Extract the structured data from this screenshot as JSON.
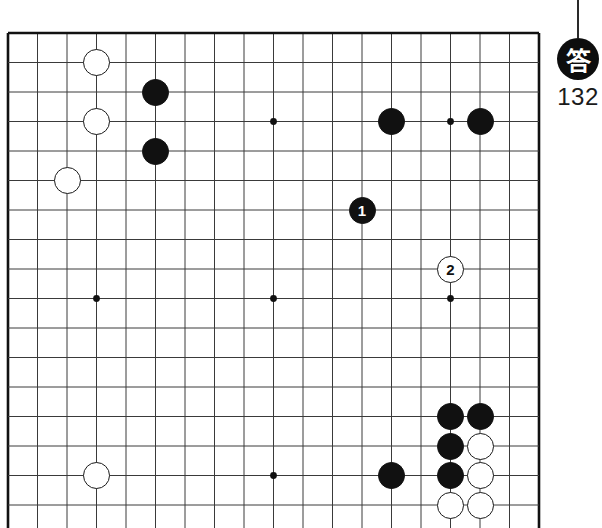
{
  "diagram": {
    "type": "go-board-problem",
    "board": {
      "origin_x": 8,
      "origin_y": 33,
      "spacing": 29.5,
      "cols": 18,
      "rows": 17,
      "line_color": "#3a3a3a",
      "border_color": "#111111",
      "background": "#ffffff",
      "star_points": [
        {
          "col": 3,
          "row": 3
        },
        {
          "col": 9,
          "row": 3
        },
        {
          "col": 15,
          "row": 3
        },
        {
          "col": 3,
          "row": 9
        },
        {
          "col": 9,
          "row": 9
        },
        {
          "col": 15,
          "row": 9
        },
        {
          "col": 9,
          "row": 15
        }
      ]
    },
    "stones": [
      {
        "color": "white",
        "col": 3,
        "row": 1,
        "label": ""
      },
      {
        "color": "black",
        "col": 5,
        "row": 2,
        "label": ""
      },
      {
        "color": "white",
        "col": 3,
        "row": 3,
        "label": ""
      },
      {
        "color": "black",
        "col": 5,
        "row": 4,
        "label": ""
      },
      {
        "color": "white",
        "col": 2,
        "row": 5,
        "label": ""
      },
      {
        "color": "black",
        "col": 13,
        "row": 3,
        "label": ""
      },
      {
        "color": "black",
        "col": 16,
        "row": 3,
        "label": ""
      },
      {
        "color": "black",
        "col": 12,
        "row": 6,
        "label": "1"
      },
      {
        "color": "white",
        "col": 15,
        "row": 8,
        "label": "2"
      },
      {
        "color": "black",
        "col": 15,
        "row": 13,
        "label": ""
      },
      {
        "color": "black",
        "col": 16,
        "row": 13,
        "label": ""
      },
      {
        "color": "black",
        "col": 15,
        "row": 14,
        "label": ""
      },
      {
        "color": "white",
        "col": 16,
        "row": 14,
        "label": ""
      },
      {
        "color": "black",
        "col": 15,
        "row": 15,
        "label": ""
      },
      {
        "color": "white",
        "col": 16,
        "row": 15,
        "label": ""
      },
      {
        "color": "black",
        "col": 13,
        "row": 15,
        "label": ""
      },
      {
        "color": "white",
        "col": 15,
        "row": 16,
        "label": ""
      },
      {
        "color": "white",
        "col": 16,
        "row": 16,
        "label": ""
      },
      {
        "color": "white",
        "col": 3,
        "row": 15,
        "label": ""
      }
    ],
    "stone_radius": 13.5
  },
  "answer_badge": {
    "symbol": "答",
    "number": "132",
    "stem": {
      "x": 578,
      "top": 0,
      "height": 38
    },
    "circle": {
      "cx": 578,
      "cy": 62
    },
    "circle_color": "#0d0d0d",
    "text_color": "#ffffff",
    "number_color": "#1a1a1a"
  }
}
